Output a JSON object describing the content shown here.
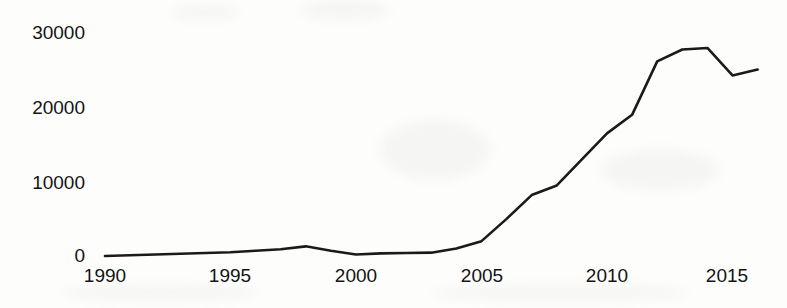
{
  "chart_data": {
    "type": "line",
    "title": "",
    "xlabel": "",
    "ylabel": "",
    "xlim": [
      1990,
      2016
    ],
    "ylim": [
      0,
      30000
    ],
    "grid": false,
    "legend": "none",
    "line_color": "#1a1a1a",
    "x": [
      1990,
      1991,
      1992,
      1993,
      1994,
      1995,
      1996,
      1997,
      1998,
      1999,
      2000,
      2001,
      2002,
      2003,
      2004,
      2005,
      2006,
      2007,
      2008,
      2009,
      2010,
      2011,
      2012,
      2013,
      2014,
      2015,
      2016
    ],
    "values": [
      0,
      100,
      200,
      300,
      400,
      500,
      700,
      900,
      1300,
      700,
      200,
      350,
      400,
      450,
      1000,
      2000,
      5000,
      8200,
      9500,
      13000,
      16500,
      19000,
      26200,
      27800,
      28000,
      24300,
      25100
    ],
    "series": [
      {
        "name": "series-1",
        "values": [
          0,
          100,
          200,
          300,
          400,
          500,
          700,
          900,
          1300,
          700,
          200,
          350,
          400,
          450,
          1000,
          2000,
          5000,
          8200,
          9500,
          13000,
          16500,
          19000,
          26200,
          27800,
          28000,
          24300,
          25100
        ]
      }
    ],
    "y_ticks": [
      0,
      10000,
      20000,
      30000
    ],
    "y_tick_labels": [
      "0",
      "10000",
      "20000",
      "30000"
    ],
    "x_ticks": [
      1990,
      1995,
      2000,
      2005,
      2010,
      2015
    ],
    "x_tick_labels": [
      "1990",
      "1995",
      "2000",
      "2005",
      "2010",
      "2015"
    ]
  },
  "axes": {
    "y_labels": [
      {
        "text": "30000",
        "value": 30000
      },
      {
        "text": "20000",
        "value": 20000
      },
      {
        "text": "10000",
        "value": 10000
      },
      {
        "text": "0",
        "value": 0
      }
    ],
    "x_labels": [
      {
        "text": "1990",
        "value": 1990
      },
      {
        "text": "1995",
        "value": 1995
      },
      {
        "text": "2000",
        "value": 2000
      },
      {
        "text": "2005",
        "value": 2005
      },
      {
        "text": "2010",
        "value": 2010
      },
      {
        "text": "2015",
        "value": 2015
      }
    ]
  }
}
